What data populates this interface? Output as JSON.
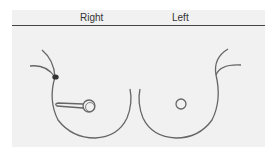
{
  "diagram": {
    "type": "breast-diagram",
    "labels": {
      "right": "Right",
      "left": "Left"
    },
    "colors": {
      "background": "#f1f1f1",
      "stroke": "#666666",
      "header_line": "#444444",
      "marker": "#333333"
    },
    "elements": [
      {
        "name": "right-breast-outline",
        "side": "right"
      },
      {
        "name": "right-nipple",
        "side": "right"
      },
      {
        "name": "right-lesion-wedge",
        "side": "right",
        "direction": "pointing toward outer/left of image"
      },
      {
        "name": "axillary-marker",
        "side": "right",
        "shape": "filled dot"
      },
      {
        "name": "left-breast-outline",
        "side": "left"
      },
      {
        "name": "left-nipple",
        "side": "left"
      }
    ]
  }
}
